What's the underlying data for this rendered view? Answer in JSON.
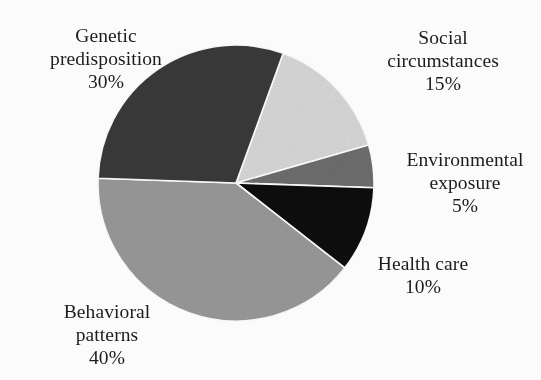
{
  "figure": {
    "background_color": "#fdfdfd",
    "text_color": "#1c1c1c"
  },
  "chart_data": {
    "type": "pie",
    "title": "",
    "subtitle": "",
    "xlabel": "",
    "ylabel": "",
    "legend_position": "none",
    "grid": false,
    "labels_outside": true,
    "start_angle_deg_clockwise_from_top": 20,
    "direction": "clockwise",
    "center": {
      "x": 236,
      "y": 183
    },
    "radius": 138,
    "categories": [
      "Social circumstances",
      "Environmental exposure",
      "Health care",
      "Behavioral patterns",
      "Genetic predisposition"
    ],
    "values": [
      15,
      5,
      10,
      40,
      30
    ],
    "value_labels": [
      "15%",
      "5%",
      "10%",
      "40%",
      "30%"
    ],
    "colors": [
      "#d8d8d8",
      "#6e6e6e",
      "#111111",
      "#999999",
      "#3a3a3a"
    ],
    "slices": [
      {
        "name": "Social circumstances",
        "value": 15,
        "value_label": "15%",
        "color": "#d8d8d8",
        "start_deg": 20,
        "end_deg": 74
      },
      {
        "name": "Environmental exposure",
        "value": 5,
        "value_label": "5%",
        "color": "#6e6e6e",
        "start_deg": 74,
        "end_deg": 92
      },
      {
        "name": "Health care",
        "value": 10,
        "value_label": "10%",
        "color": "#111111",
        "start_deg": 92,
        "end_deg": 128
      },
      {
        "name": "Behavioral patterns",
        "value": 40,
        "value_label": "40%",
        "color": "#999999",
        "start_deg": 128,
        "end_deg": 272
      },
      {
        "name": "Genetic predisposition",
        "value": 30,
        "value_label": "30%",
        "color": "#3a3a3a",
        "start_deg": 272,
        "end_deg": 380
      }
    ]
  },
  "labels": {
    "genetic": {
      "line1": "Genetic",
      "line2": "predisposition",
      "percent": "30%"
    },
    "social": {
      "line1": "Social",
      "line2": "circumstances",
      "percent": "15%"
    },
    "environmental": {
      "line1": "Environmental",
      "line2": "exposure",
      "percent": "5%"
    },
    "healthcare": {
      "line1": "Health care",
      "line2": "",
      "percent": "10%"
    },
    "behavioral": {
      "line1": "Behavioral",
      "line2": "patterns",
      "percent": "40%"
    }
  }
}
